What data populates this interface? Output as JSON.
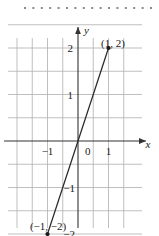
{
  "figure": {
    "kind": "coordinate-plane-line-graph",
    "background_color": "#ffffff",
    "top_rule": {
      "style": "dotted-squares",
      "count": 16,
      "color": "#8a8a8a",
      "dot_size_px": 2
    },
    "grid": {
      "visible": true,
      "color": "#b3b3b3",
      "x_gridlines": [
        -2,
        -1.5,
        -1,
        -0.5,
        0.5,
        1,
        1.5
      ],
      "y_gridlines": [
        2.5,
        2,
        1.5,
        1,
        0.5,
        -0.5,
        -1,
        -1.5,
        -2
      ]
    },
    "axes": {
      "color": "#333333",
      "x_label": "x",
      "y_label": "y",
      "x_arrow": true,
      "y_arrow": true,
      "origin_label": "0"
    },
    "ticks": {
      "x": [
        {
          "value": -1,
          "label": "−1"
        },
        {
          "value": 0,
          "label": "0"
        },
        {
          "value": 1,
          "label": "1"
        }
      ],
      "y": [
        {
          "value": 2,
          "label": "2"
        },
        {
          "value": 1,
          "label": "1"
        },
        {
          "value": -1,
          "label": "−1"
        },
        {
          "value": -2,
          "label": "−2"
        }
      ]
    },
    "points": [
      {
        "id": "p-upper",
        "x": 1,
        "y": 2,
        "label": "(1, 2)"
      },
      {
        "id": "p-lower",
        "x": -1,
        "y": -2,
        "label": "(−1, −2)"
      }
    ],
    "line": {
      "color": "#2b2b2b",
      "from": {
        "x": -1,
        "y": -2
      },
      "to": {
        "x": 1,
        "y": 2
      },
      "slope": 2,
      "intercept": 0
    }
  },
  "chart_data": {
    "type": "line",
    "title": "",
    "xlabel": "x",
    "ylabel": "y",
    "xlim": [
      -2.2,
      1.9
    ],
    "ylim": [
      -2.6,
      2.8
    ],
    "grid": true,
    "legend": "none",
    "x": [
      -1,
      1
    ],
    "series": [
      {
        "name": "y = 2x",
        "values": [
          -2,
          2
        ],
        "color": "#2b2b2b",
        "markers": true
      }
    ],
    "annotations": [
      {
        "text": "(1, 2)",
        "x": 1,
        "y": 2
      },
      {
        "text": "(−1, −2)",
        "x": -1,
        "y": -2
      }
    ],
    "xticks": [
      -1,
      0,
      1
    ],
    "xticklabels": [
      "−1",
      "0",
      "1"
    ],
    "yticks": [
      -2,
      -1,
      1,
      2
    ],
    "yticklabels": [
      "−2",
      "−1",
      "1",
      "2"
    ]
  }
}
